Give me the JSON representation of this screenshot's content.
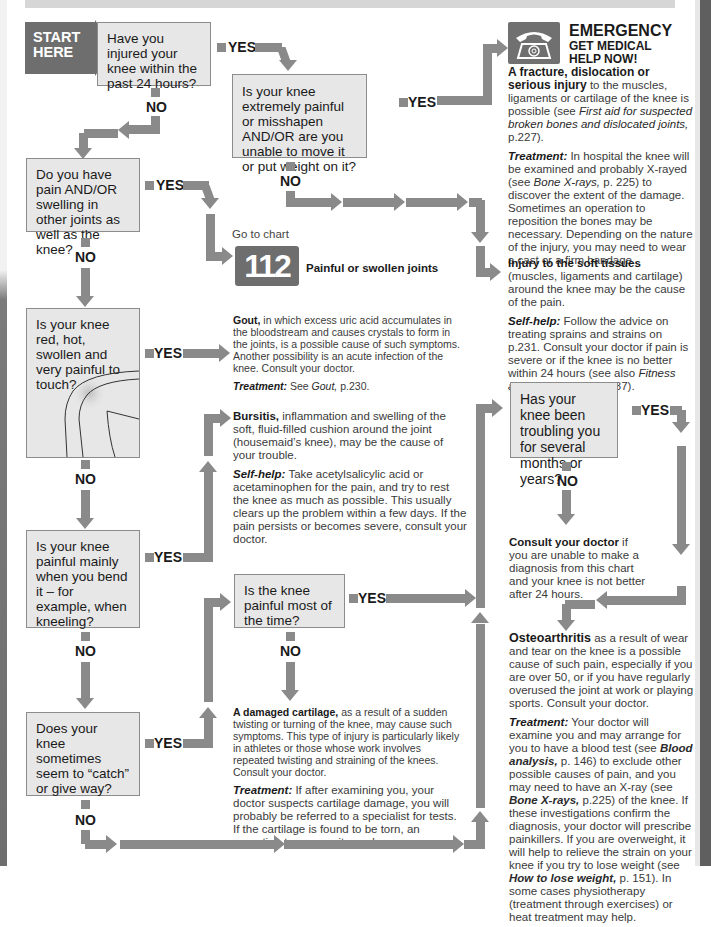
{
  "start": {
    "label_line1": "START",
    "label_line2": "HERE"
  },
  "labels": {
    "yes": "YES",
    "no": "NO"
  },
  "questions": [
    {
      "id": "q1",
      "text": "Have you injured your knee within the past 24 hours?"
    },
    {
      "id": "q2",
      "text": "Is your knee extremely painful or misshapen AND/OR are you unable to move it or put weight on it?"
    },
    {
      "id": "q3",
      "text": "Do you have pain AND/OR swelling in other joints as well as the knee?"
    },
    {
      "id": "q4",
      "text": "Is your knee red, hot, swollen and very painful to touch?"
    },
    {
      "id": "q5",
      "text": "Is your knee painful mainly when you bend it – for example, when kneeling?"
    },
    {
      "id": "q6",
      "text": "Is the knee painful most of the time?"
    },
    {
      "id": "q7",
      "text": "Does your knee sometimes seem to “catch” or give way?"
    },
    {
      "id": "q8",
      "text": "Has your knee been troubling you for several months or years?"
    }
  ],
  "emergency": {
    "title": "EMERGENCY",
    "subtitle_line1": "GET MEDICAL",
    "subtitle_line2": "HELP NOW!",
    "icon": "telephone-icon",
    "p1_bold": "A fracture, dislocation or serious injury",
    "p1_rest": " to the muscles, ligaments or cartilage of the knee is possible (see ",
    "p1_ref": "First aid for suspected broken bones and dislocated joints,",
    "p1_end": " p.227).",
    "p2_kw": "Treatment:",
    "p2_a": " In hospital the knee will be examined and probably X-rayed (see ",
    "p2_ref": "Bone X-rays,",
    "p2_b": " p. 225) to discover the extent of the damage. Sometimes an operation to reposition the bones may be necessary. Depending on the nature of the injury, you may need to wear a cast or a firm bandage."
  },
  "soft_tissue": {
    "p1_bold": "Injury to the soft tissues",
    "p1_rest": " (muscles, ligaments and cartilage) around the knee may be the cause of the pain.",
    "p2_kw": "Self-help:",
    "p2_a": " Follow the advice on treating sprains and strains on p.231. Consult your doctor if pain is severe or if the knee is no better within 24 hours (see also ",
    "p2_ref": "Fitness and exercise,",
    "p2_b": " pp.36–37)."
  },
  "goto_chart": {
    "prefix": "Go to chart",
    "number": "112",
    "name": "Painful or swollen joints"
  },
  "gout": {
    "p1_bold": "Gout,",
    "p1_rest": " in which excess uric acid accumulates in the bloodstream and causes crystals to form in the joints, is a possible cause of such symptoms. Another possibility is an acute infection of the knee. Consult your doctor.",
    "p2_kw": "Treatment:",
    "p2_a": " See ",
    "p2_ref": "Gout,",
    "p2_b": " p.230."
  },
  "bursitis": {
    "p1_bold": "Bursitis,",
    "p1_rest": " inflammation and swelling of the soft, fluid-filled cushion around the joint (housemaid’s knee), may be the cause of your trouble.",
    "p2_kw": "Self-help:",
    "p2_a": " Take acetylsalicylic acid or acetaminophen for the pain, and try to rest the knee as much as possible. This usually clears up the problem within a few days. If the pain persists or becomes severe, consult your doctor."
  },
  "consult": {
    "p1_bold": "Consult your doctor",
    "p1_rest": " if you are unable to make a diagnosis from this chart and your knee is not better after 24 hours."
  },
  "cartilage": {
    "p1_bold": "A damaged cartilage,",
    "p1_rest": " as a result of a sudden twisting or turning of the knee, may cause such symptoms. This type of injury is particularly likely in athletes or those whose work involves repeated twisting and straining of the knees. Consult your doctor.",
    "p2_kw": "Treatment:",
    "p2_a": " If after examining you, your doctor suspects cartilage damage, you will probably be referred to a specialist for tests. If the cartilage is found to be torn, an operation to remove it may be necessary."
  },
  "osteo": {
    "p1_bold": "Osteoarthritis",
    "p1_rest": " as a result of wear and tear on the knee is a possible cause of such pain, especially if you are over 50, or if you have regularly overused the joint at work or playing sports. Consult your doctor.",
    "p2_kw": "Treatment:",
    "p2_a": " Your doctor will examine you and may arrange for you to have a blood test (see ",
    "p2_ref1": "Blood analysis,",
    "p2_b": " p. 146) to exclude other possible causes of pain, and you may need to have an X-ray (see ",
    "p2_ref2": "Bone X-rays,",
    "p2_c": " p.225) of the knee. If these investigations confirm the diagnosis, your doctor will prescribe painkillers. If you are overweight, it will help to relieve the strain on your knee if you try to lose weight (see ",
    "p2_ref3": "How to lose weight,",
    "p2_d": " p. 151). In some cases physiotherapy (treatment through exercises) or heat treatment may help."
  },
  "colors": {
    "box_fill": "#e7e7e7",
    "arrow": "#8a8a8a",
    "dark": "#6e6e6e"
  }
}
